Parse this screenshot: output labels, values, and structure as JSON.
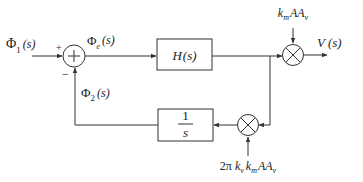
{
  "diagram": {
    "type": "block-diagram",
    "colors": {
      "line": "#333333",
      "text": "#222222",
      "background": "#ffffff"
    },
    "input": {
      "symbol": "Φ",
      "subscript": "1",
      "arg": "(s)"
    },
    "summing_junction": {
      "symbol": "+",
      "plus_sign": "+",
      "minus_sign": "−"
    },
    "error_signal": {
      "symbol": "Φ",
      "subscript": "e",
      "arg": "(s)"
    },
    "forward_block": {
      "label": "H(s)",
      "fn": "H",
      "arg": "(s)"
    },
    "output_multiplier": {
      "symbol": "×",
      "gain": {
        "k": "k",
        "k_sub": "m",
        "rest": "AA",
        "rest_sub": "v"
      }
    },
    "output": {
      "label": "V",
      "arg": "(s)"
    },
    "feedback_multiplier": {
      "symbol": "×",
      "gain": {
        "prefix": "2π",
        "k1": "k",
        "k1_sub": "v",
        "k2": "k",
        "k2_sub": "m",
        "rest": "AA",
        "rest_sub": "v"
      }
    },
    "integrator_block": {
      "numerator": "1",
      "denominator": "s"
    },
    "feedback_signal": {
      "symbol": "Φ",
      "subscript": "2",
      "arg": "(s)"
    }
  }
}
